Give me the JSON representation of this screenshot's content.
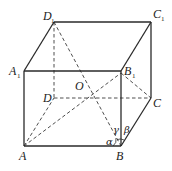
{
  "figure": {
    "type": "rectangular prism (cuboid) with diagonals",
    "vertices": {
      "A": {
        "label": "A",
        "sub": ""
      },
      "B": {
        "label": "B",
        "sub": ""
      },
      "C": {
        "label": "C",
        "sub": ""
      },
      "D": {
        "label": "D",
        "sub": ""
      },
      "A1": {
        "label": "A",
        "sub": "1"
      },
      "B1": {
        "label": "B",
        "sub": "1"
      },
      "C1": {
        "label": "C",
        "sub": "1"
      },
      "D1": {
        "label": "D",
        "sub": "1"
      },
      "O": {
        "label": "O",
        "sub": ""
      }
    },
    "angles": {
      "alpha": "α",
      "beta": "β",
      "gamma": "γ"
    },
    "solid_edges": [
      "A1B1",
      "B1C1",
      "C1D1",
      "D1A1",
      "AA1",
      "AB",
      "BB1",
      "BC",
      "CC1"
    ],
    "dashed_edges": [
      "DD1",
      "AD",
      "DC",
      "AB1",
      "D1B",
      "B1C"
    ]
  }
}
